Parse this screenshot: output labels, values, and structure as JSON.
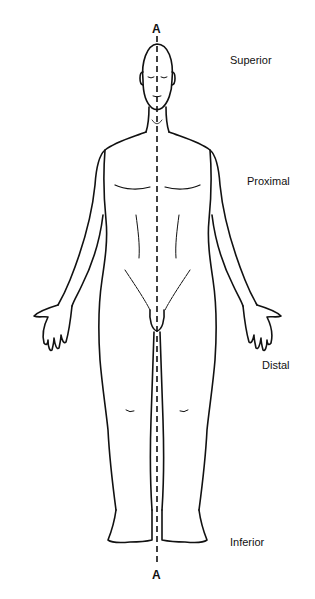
{
  "figure": {
    "type": "anatomical-position-diagram",
    "view": "anterior",
    "axis": {
      "top_label": "A",
      "bottom_label": "A",
      "style": "dashed-midline"
    },
    "direction_labels": [
      {
        "id": "superior",
        "text": "Superior"
      },
      {
        "id": "proximal",
        "text": "Proximal"
      },
      {
        "id": "distal",
        "text": "Distal"
      },
      {
        "id": "inferior",
        "text": "Inferior"
      }
    ]
  }
}
